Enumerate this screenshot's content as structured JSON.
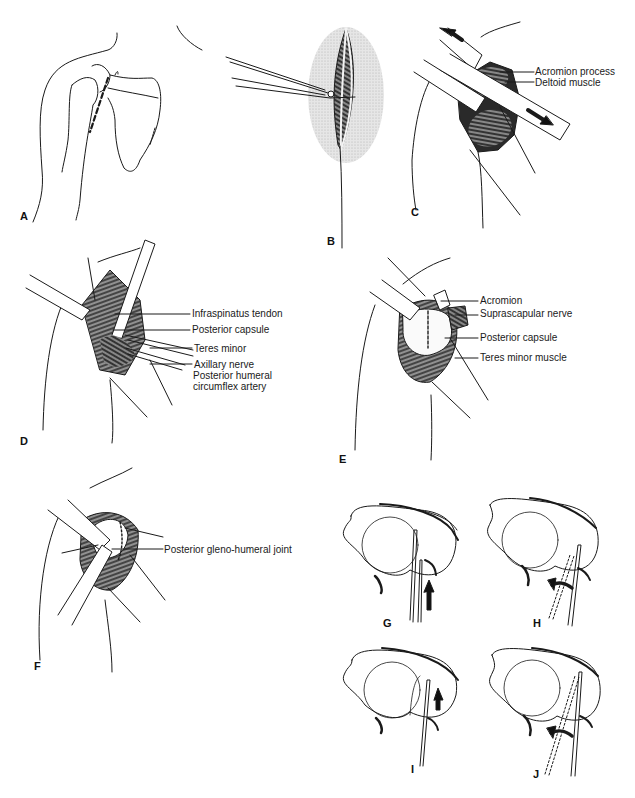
{
  "figure": {
    "type": "surgical illustration sequence",
    "panels": [
      {
        "id": "A",
        "label": "A",
        "labels": []
      },
      {
        "id": "B",
        "label": "B",
        "labels": []
      },
      {
        "id": "C",
        "label": "C",
        "labels": [
          "Acromion process",
          "Deltoid muscle"
        ]
      },
      {
        "id": "D",
        "label": "D",
        "labels": [
          "Infraspinatus tendon",
          "Posterior capsule",
          "Teres minor",
          "Axillary nerve",
          "Posterior humeral",
          "circumflex artery"
        ]
      },
      {
        "id": "E",
        "label": "E",
        "labels": [
          "Acromion",
          "Suprascapular nerve",
          "Posterior capsule",
          "Teres minor muscle"
        ]
      },
      {
        "id": "F",
        "label": "F",
        "labels": [
          "Posterior gleno-humeral joint"
        ]
      },
      {
        "id": "G",
        "label": "G",
        "labels": []
      },
      {
        "id": "H",
        "label": "H",
        "labels": []
      },
      {
        "id": "I",
        "label": "I",
        "labels": []
      },
      {
        "id": "J",
        "label": "J",
        "labels": []
      }
    ]
  },
  "colors": {
    "line": "#1a1a1a",
    "shade": "#d9d9d9",
    "background": "#ffffff"
  }
}
